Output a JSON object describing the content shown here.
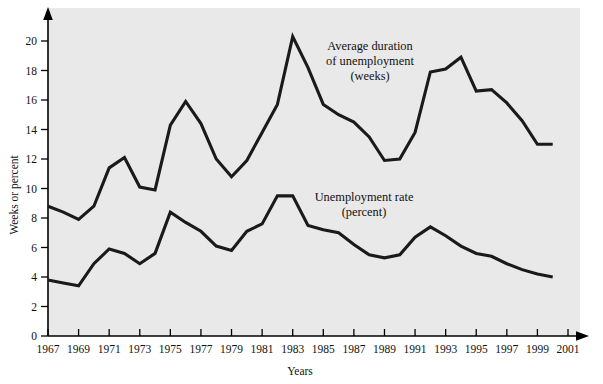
{
  "chart_data": {
    "type": "line",
    "title": "",
    "xlabel": "Years",
    "ylabel": "Weeks or percent",
    "xlim": [
      1967,
      2001
    ],
    "ylim": [
      0,
      20
    ],
    "grid": false,
    "legend_position": "inline-annotation",
    "x": [
      1967,
      1968,
      1969,
      1970,
      1971,
      1972,
      1973,
      1974,
      1975,
      1976,
      1977,
      1978,
      1979,
      1980,
      1981,
      1982,
      1983,
      1984,
      1985,
      1986,
      1987,
      1988,
      1989,
      1990,
      1991,
      1992,
      1993,
      1994,
      1995,
      1996,
      1997,
      1998,
      1999,
      2000
    ],
    "xtick_labels": [
      "1967",
      "1969",
      "1971",
      "1973",
      "1975",
      "1977",
      "1979",
      "1981",
      "1983",
      "1985",
      "1987",
      "1989",
      "1991",
      "1993",
      "1995",
      "1997",
      "1999",
      "2001"
    ],
    "xtick_values": [
      1967,
      1969,
      1971,
      1973,
      1975,
      1977,
      1979,
      1981,
      1983,
      1985,
      1987,
      1989,
      1991,
      1993,
      1995,
      1997,
      1999,
      2001
    ],
    "ytick_labels": [
      "0",
      "2",
      "4",
      "6",
      "8",
      "10",
      "12",
      "14",
      "16",
      "18",
      "20"
    ],
    "ytick_values": [
      0,
      2,
      4,
      6,
      8,
      10,
      12,
      14,
      16,
      18,
      20
    ],
    "series": [
      {
        "name": "Average duration of unemployment (weeks)",
        "annotation": [
          "Average duration",
          "of unemployment",
          "(weeks)"
        ],
        "color": "#1a1a1a",
        "values": [
          8.8,
          8.4,
          7.9,
          8.8,
          11.4,
          12.1,
          10.1,
          9.9,
          14.3,
          15.9,
          14.4,
          12.0,
          10.8,
          11.9,
          13.8,
          15.7,
          20.3,
          18.2,
          15.7,
          15.0,
          14.5,
          13.5,
          11.9,
          12.0,
          13.8,
          17.9,
          18.1,
          18.9,
          16.6,
          16.7,
          15.8,
          14.6,
          13.0,
          13.0
        ]
      },
      {
        "name": "Unemployment rate (percent)",
        "annotation": [
          "Unemployment rate",
          "(percent)"
        ],
        "color": "#1a1a1a",
        "values": [
          3.8,
          3.6,
          3.4,
          4.9,
          5.9,
          5.6,
          4.9,
          5.6,
          8.4,
          7.7,
          7.1,
          6.1,
          5.8,
          7.1,
          7.6,
          9.5,
          9.5,
          7.5,
          7.2,
          7.0,
          6.2,
          5.5,
          5.3,
          5.5,
          6.7,
          7.4,
          6.8,
          6.1,
          5.6,
          5.4,
          4.9,
          4.5,
          4.2,
          4.0
        ]
      }
    ]
  },
  "annotations": {
    "upper": {
      "line1": "Average duration",
      "line2": "of unemployment",
      "line3": "(weeks)"
    },
    "lower": {
      "line1": "Unemployment rate",
      "line2": "(percent)"
    }
  },
  "axes": {
    "y_title": "Weeks or percent",
    "x_title": "Years"
  }
}
